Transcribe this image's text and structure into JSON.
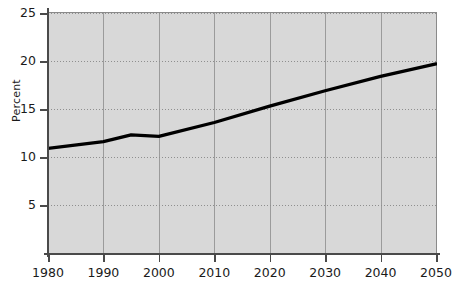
{
  "chart_data": {
    "type": "line",
    "title": "",
    "xlabel": "",
    "ylabel": "Percent",
    "xlim": [
      1980,
      2050
    ],
    "ylim": [
      0,
      25
    ],
    "grid": true,
    "legend": false,
    "x_ticks": [
      "1980",
      "1990",
      "2000",
      "2010",
      "2020",
      "2030",
      "2040",
      "2050"
    ],
    "y_ticks": [
      "5",
      "10",
      "15",
      "20",
      "25"
    ],
    "x": [
      1980,
      1990,
      1995,
      2000,
      2010,
      2020,
      2030,
      2040,
      2050
    ],
    "series": [
      {
        "name": "Percent",
        "color": "#000000",
        "values": [
          10.9,
          11.6,
          12.3,
          12.15,
          13.6,
          15.3,
          16.9,
          18.4,
          19.7
        ]
      }
    ]
  },
  "axes": {
    "y_title": "Percent",
    "y_tick_labels": [
      "25",
      "20",
      "15",
      "10",
      "5"
    ],
    "y_tick_values": [
      25,
      20,
      15,
      10,
      5
    ],
    "x_tick_labels": [
      "1980",
      "1990",
      "2000",
      "2010",
      "2020",
      "2030",
      "2040",
      "2050"
    ],
    "x_tick_values": [
      1980,
      1990,
      2000,
      2010,
      2020,
      2030,
      2040,
      2050
    ]
  },
  "style": {
    "plot_background": "#d8d8d8",
    "line_color": "#000000",
    "axis_color": "#4a4a4a",
    "gridline_color": "#9b9b9b",
    "page_background": "#ffffff"
  }
}
